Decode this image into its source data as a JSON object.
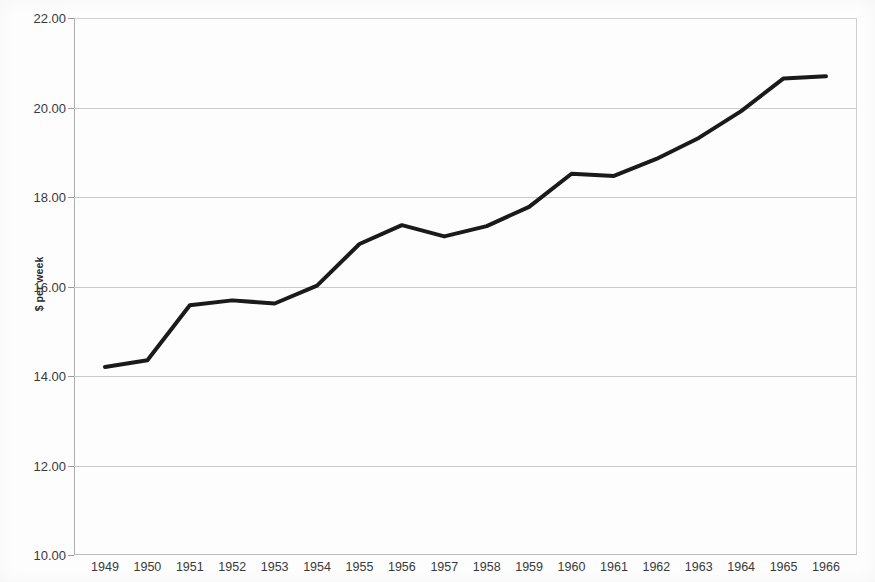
{
  "chart_data": {
    "type": "line",
    "title": "",
    "xlabel": "",
    "ylabel": "$ per week",
    "ylim": [
      10.0,
      22.0
    ],
    "y_ticks": [
      10.0,
      12.0,
      14.0,
      16.0,
      18.0,
      20.0,
      22.0
    ],
    "y_tick_labels": [
      "10.00",
      "12.00",
      "14.00",
      "16.00",
      "18.00",
      "20.00",
      "22.00"
    ],
    "grid": "horizontal",
    "legend": "none",
    "categories": [
      "1949",
      "1950",
      "1951",
      "1952",
      "1953",
      "1954",
      "1955",
      "1956",
      "1957",
      "1958",
      "1959",
      "1960",
      "1961",
      "1962",
      "1963",
      "1964",
      "1965",
      "1966"
    ],
    "values": [
      14.2,
      14.35,
      15.58,
      15.69,
      15.62,
      16.02,
      16.95,
      17.37,
      17.12,
      17.35,
      17.78,
      18.52,
      18.47,
      18.85,
      19.32,
      19.92,
      20.65,
      20.7
    ],
    "series": [
      {
        "name": "$ per week",
        "color": "#1a1a1a",
        "line_width": 4,
        "values": [
          14.2,
          14.35,
          15.58,
          15.69,
          15.62,
          16.02,
          16.95,
          17.37,
          17.12,
          17.35,
          17.78,
          18.52,
          18.47,
          18.85,
          19.32,
          19.92,
          20.65,
          20.7
        ]
      }
    ]
  },
  "colors": {
    "series_line": "#1a1a1a",
    "gridline": "#c9c9c9",
    "axis": "#aeaeae",
    "text": "#3a3a3a",
    "background": "#fdfdfd"
  }
}
